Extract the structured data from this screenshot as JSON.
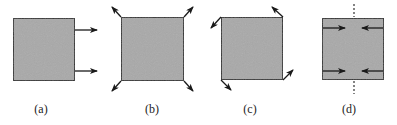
{
  "figure": {
    "panels": [
      {
        "id": "a",
        "label": "(a)",
        "description": "Square with two horizontal arrows pointing right from the right edge (uniform tension/translation)"
      },
      {
        "id": "b",
        "label": "(b)",
        "description": "Square with diagonal arrows pointing outward from all four corners (uniform expansion)"
      },
      {
        "id": "c",
        "label": "(c)",
        "description": "Square with corner arrows in a rotational/shear pattern"
      },
      {
        "id": "d",
        "label": "(d)",
        "description": "Square with dotted vertical center line and four horizontal arrows pointing inward toward the center line (compression)"
      }
    ],
    "colors": {
      "fill": "#a9a9a9",
      "stroke": "#333333",
      "arrow": "#1a1a1a",
      "dotted_line": "#333333"
    }
  }
}
